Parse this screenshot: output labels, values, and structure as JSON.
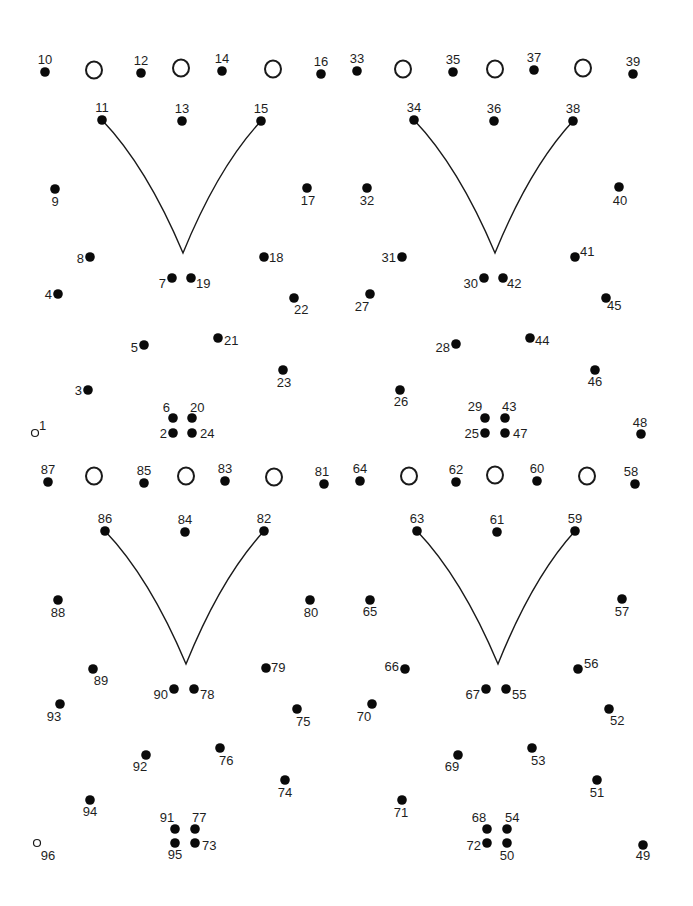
{
  "puzzle": {
    "type": "dot-to-dot",
    "total_dots": 96,
    "start_dot": 1,
    "end_dot": 96,
    "colors": {
      "ink": "#111111",
      "background": "#ffffff"
    }
  },
  "dots": [
    {
      "n": 1,
      "x": 35,
      "y": 433,
      "lx": 39,
      "ly": 430,
      "anchor": "start",
      "open": true
    },
    {
      "n": 2,
      "x": 173,
      "y": 433,
      "lx": 167,
      "ly": 438,
      "anchor": "end"
    },
    {
      "n": 3,
      "x": 88,
      "y": 390,
      "lx": 82,
      "ly": 395,
      "anchor": "end"
    },
    {
      "n": 4,
      "x": 58,
      "y": 294,
      "lx": 52,
      "ly": 299,
      "anchor": "end"
    },
    {
      "n": 5,
      "x": 144,
      "y": 345,
      "lx": 138,
      "ly": 352,
      "anchor": "end"
    },
    {
      "n": 6,
      "x": 173,
      "y": 418,
      "lx": 170,
      "ly": 412,
      "anchor": "end"
    },
    {
      "n": 7,
      "x": 172,
      "y": 278,
      "lx": 166,
      "ly": 288,
      "anchor": "end"
    },
    {
      "n": 8,
      "x": 90,
      "y": 257,
      "lx": 84,
      "ly": 263,
      "anchor": "end"
    },
    {
      "n": 9,
      "x": 55,
      "y": 189,
      "lx": 55,
      "ly": 206,
      "anchor": "middle"
    },
    {
      "n": 10,
      "x": 45,
      "y": 72,
      "lx": 45,
      "ly": 64,
      "anchor": "middle"
    },
    {
      "n": 11,
      "x": 102,
      "y": 120,
      "lx": 102,
      "ly": 112,
      "anchor": "middle"
    },
    {
      "n": 12,
      "x": 141,
      "y": 73,
      "lx": 141,
      "ly": 65,
      "anchor": "middle"
    },
    {
      "n": 13,
      "x": 182,
      "y": 121,
      "lx": 182,
      "ly": 113,
      "anchor": "middle"
    },
    {
      "n": 14,
      "x": 222,
      "y": 71,
      "lx": 222,
      "ly": 63,
      "anchor": "middle"
    },
    {
      "n": 15,
      "x": 261,
      "y": 121,
      "lx": 261,
      "ly": 113,
      "anchor": "middle"
    },
    {
      "n": 16,
      "x": 321,
      "y": 74,
      "lx": 321,
      "ly": 66,
      "anchor": "middle"
    },
    {
      "n": 17,
      "x": 307,
      "y": 188,
      "lx": 308,
      "ly": 205,
      "anchor": "middle"
    },
    {
      "n": 18,
      "x": 264,
      "y": 257,
      "lx": 269,
      "ly": 262,
      "anchor": "start"
    },
    {
      "n": 19,
      "x": 191,
      "y": 278,
      "lx": 196,
      "ly": 288,
      "anchor": "start"
    },
    {
      "n": 20,
      "x": 192,
      "y": 418,
      "lx": 190,
      "ly": 412,
      "anchor": "start"
    },
    {
      "n": 21,
      "x": 218,
      "y": 338,
      "lx": 224,
      "ly": 345,
      "anchor": "start"
    },
    {
      "n": 22,
      "x": 294,
      "y": 298,
      "lx": 294,
      "ly": 314,
      "anchor": "start"
    },
    {
      "n": 23,
      "x": 283,
      "y": 370,
      "lx": 284,
      "ly": 387,
      "anchor": "middle"
    },
    {
      "n": 24,
      "x": 192,
      "y": 433,
      "lx": 200,
      "ly": 438,
      "anchor": "start"
    },
    {
      "n": 25,
      "x": 485,
      "y": 433,
      "lx": 479,
      "ly": 438,
      "anchor": "end"
    },
    {
      "n": 26,
      "x": 400,
      "y": 390,
      "lx": 401,
      "ly": 406,
      "anchor": "middle"
    },
    {
      "n": 27,
      "x": 370,
      "y": 294,
      "lx": 362,
      "ly": 311,
      "anchor": "middle"
    },
    {
      "n": 28,
      "x": 456,
      "y": 344,
      "lx": 450,
      "ly": 352,
      "anchor": "end"
    },
    {
      "n": 29,
      "x": 485,
      "y": 418,
      "lx": 475,
      "ly": 411,
      "anchor": "middle"
    },
    {
      "n": 30,
      "x": 484,
      "y": 278,
      "lx": 478,
      "ly": 288,
      "anchor": "end"
    },
    {
      "n": 31,
      "x": 402,
      "y": 257,
      "lx": 396,
      "ly": 262,
      "anchor": "end"
    },
    {
      "n": 32,
      "x": 367,
      "y": 188,
      "lx": 367,
      "ly": 205,
      "anchor": "middle"
    },
    {
      "n": 33,
      "x": 357,
      "y": 71,
      "lx": 357,
      "ly": 63,
      "anchor": "middle"
    },
    {
      "n": 34,
      "x": 414,
      "y": 120,
      "lx": 414,
      "ly": 112,
      "anchor": "middle"
    },
    {
      "n": 35,
      "x": 453,
      "y": 72,
      "lx": 453,
      "ly": 64,
      "anchor": "middle"
    },
    {
      "n": 36,
      "x": 494,
      "y": 121,
      "lx": 494,
      "ly": 113,
      "anchor": "middle"
    },
    {
      "n": 37,
      "x": 534,
      "y": 70,
      "lx": 534,
      "ly": 62,
      "anchor": "middle"
    },
    {
      "n": 38,
      "x": 573,
      "y": 121,
      "lx": 573,
      "ly": 113,
      "anchor": "middle"
    },
    {
      "n": 39,
      "x": 633,
      "y": 74,
      "lx": 633,
      "ly": 66,
      "anchor": "middle"
    },
    {
      "n": 40,
      "x": 619,
      "y": 187,
      "lx": 620,
      "ly": 205,
      "anchor": "middle"
    },
    {
      "n": 41,
      "x": 575,
      "y": 257,
      "lx": 580,
      "ly": 256,
      "anchor": "start"
    },
    {
      "n": 42,
      "x": 503,
      "y": 278,
      "lx": 507,
      "ly": 288,
      "anchor": "start"
    },
    {
      "n": 43,
      "x": 505,
      "y": 418,
      "lx": 502,
      "ly": 411,
      "anchor": "start"
    },
    {
      "n": 44,
      "x": 530,
      "y": 338,
      "lx": 535,
      "ly": 345,
      "anchor": "start"
    },
    {
      "n": 45,
      "x": 606,
      "y": 298,
      "lx": 607,
      "ly": 310,
      "anchor": "start"
    },
    {
      "n": 46,
      "x": 595,
      "y": 370,
      "lx": 595,
      "ly": 386,
      "anchor": "middle"
    },
    {
      "n": 47,
      "x": 505,
      "y": 433,
      "lx": 513,
      "ly": 438,
      "anchor": "start"
    },
    {
      "n": 48,
      "x": 641,
      "y": 434,
      "lx": 640,
      "ly": 427,
      "anchor": "middle"
    },
    {
      "n": 49,
      "x": 643,
      "y": 845,
      "lx": 643,
      "ly": 860,
      "anchor": "middle"
    },
    {
      "n": 50,
      "x": 507,
      "y": 843,
      "lx": 507,
      "ly": 860,
      "anchor": "middle"
    },
    {
      "n": 51,
      "x": 597,
      "y": 780,
      "lx": 597,
      "ly": 797,
      "anchor": "middle"
    },
    {
      "n": 52,
      "x": 609,
      "y": 709,
      "lx": 610,
      "ly": 725,
      "anchor": "start"
    },
    {
      "n": 53,
      "x": 532,
      "y": 748,
      "lx": 531,
      "ly": 765,
      "anchor": "start"
    },
    {
      "n": 54,
      "x": 507,
      "y": 829,
      "lx": 505,
      "ly": 822,
      "anchor": "start"
    },
    {
      "n": 55,
      "x": 506,
      "y": 689,
      "lx": 512,
      "ly": 699,
      "anchor": "start"
    },
    {
      "n": 56,
      "x": 578,
      "y": 669,
      "lx": 584,
      "ly": 668,
      "anchor": "start"
    },
    {
      "n": 57,
      "x": 622,
      "y": 599,
      "lx": 622,
      "ly": 616,
      "anchor": "middle"
    },
    {
      "n": 58,
      "x": 635,
      "y": 484,
      "lx": 631,
      "ly": 476,
      "anchor": "middle"
    },
    {
      "n": 59,
      "x": 575,
      "y": 531,
      "lx": 575,
      "ly": 523,
      "anchor": "middle"
    },
    {
      "n": 60,
      "x": 537,
      "y": 481,
      "lx": 537,
      "ly": 473,
      "anchor": "middle"
    },
    {
      "n": 61,
      "x": 497,
      "y": 532,
      "lx": 497,
      "ly": 524,
      "anchor": "middle"
    },
    {
      "n": 62,
      "x": 456,
      "y": 482,
      "lx": 456,
      "ly": 474,
      "anchor": "middle"
    },
    {
      "n": 63,
      "x": 417,
      "y": 531,
      "lx": 417,
      "ly": 523,
      "anchor": "middle"
    },
    {
      "n": 64,
      "x": 360,
      "y": 481,
      "lx": 360,
      "ly": 473,
      "anchor": "middle"
    },
    {
      "n": 65,
      "x": 370,
      "y": 600,
      "lx": 370,
      "ly": 616,
      "anchor": "middle"
    },
    {
      "n": 66,
      "x": 405,
      "y": 669,
      "lx": 399,
      "ly": 671,
      "anchor": "end"
    },
    {
      "n": 67,
      "x": 486,
      "y": 689,
      "lx": 480,
      "ly": 699,
      "anchor": "end"
    },
    {
      "n": 68,
      "x": 487,
      "y": 829,
      "lx": 479,
      "ly": 822,
      "anchor": "middle"
    },
    {
      "n": 69,
      "x": 458,
      "y": 755,
      "lx": 452,
      "ly": 771,
      "anchor": "middle"
    },
    {
      "n": 70,
      "x": 372,
      "y": 704,
      "lx": 364,
      "ly": 721,
      "anchor": "middle"
    },
    {
      "n": 71,
      "x": 402,
      "y": 800,
      "lx": 401,
      "ly": 817,
      "anchor": "middle"
    },
    {
      "n": 72,
      "x": 487,
      "y": 843,
      "lx": 481,
      "ly": 850,
      "anchor": "end"
    },
    {
      "n": 73,
      "x": 195,
      "y": 843,
      "lx": 202,
      "ly": 850,
      "anchor": "start"
    },
    {
      "n": 74,
      "x": 285,
      "y": 780,
      "lx": 285,
      "ly": 797,
      "anchor": "middle"
    },
    {
      "n": 75,
      "x": 297,
      "y": 709,
      "lx": 296,
      "ly": 726,
      "anchor": "start"
    },
    {
      "n": 76,
      "x": 220,
      "y": 748,
      "lx": 219,
      "ly": 765,
      "anchor": "start"
    },
    {
      "n": 77,
      "x": 195,
      "y": 829,
      "lx": 192,
      "ly": 822,
      "anchor": "start"
    },
    {
      "n": 78,
      "x": 194,
      "y": 689,
      "lx": 200,
      "ly": 699,
      "anchor": "start"
    },
    {
      "n": 79,
      "x": 266,
      "y": 668,
      "lx": 271,
      "ly": 672,
      "anchor": "start"
    },
    {
      "n": 80,
      "x": 310,
      "y": 600,
      "lx": 311,
      "ly": 617,
      "anchor": "middle"
    },
    {
      "n": 81,
      "x": 324,
      "y": 484,
      "lx": 322,
      "ly": 476,
      "anchor": "middle"
    },
    {
      "n": 82,
      "x": 264,
      "y": 531,
      "lx": 264,
      "ly": 523,
      "anchor": "middle"
    },
    {
      "n": 83,
      "x": 225,
      "y": 481,
      "lx": 225,
      "ly": 473,
      "anchor": "middle"
    },
    {
      "n": 84,
      "x": 185,
      "y": 532,
      "lx": 185,
      "ly": 524,
      "anchor": "middle"
    },
    {
      "n": 85,
      "x": 144,
      "y": 483,
      "lx": 144,
      "ly": 475,
      "anchor": "middle"
    },
    {
      "n": 86,
      "x": 105,
      "y": 531,
      "lx": 105,
      "ly": 523,
      "anchor": "middle"
    },
    {
      "n": 87,
      "x": 48,
      "y": 482,
      "lx": 48,
      "ly": 474,
      "anchor": "middle"
    },
    {
      "n": 88,
      "x": 58,
      "y": 600,
      "lx": 58,
      "ly": 617,
      "anchor": "middle"
    },
    {
      "n": 89,
      "x": 93,
      "y": 669,
      "lx": 101,
      "ly": 685,
      "anchor": "middle"
    },
    {
      "n": 90,
      "x": 174,
      "y": 689,
      "lx": 168,
      "ly": 699,
      "anchor": "end"
    },
    {
      "n": 91,
      "x": 175,
      "y": 829,
      "lx": 167,
      "ly": 822,
      "anchor": "middle"
    },
    {
      "n": 92,
      "x": 146,
      "y": 755,
      "lx": 140,
      "ly": 771,
      "anchor": "middle"
    },
    {
      "n": 93,
      "x": 60,
      "y": 704,
      "lx": 54,
      "ly": 721,
      "anchor": "middle"
    },
    {
      "n": 94,
      "x": 90,
      "y": 800,
      "lx": 90,
      "ly": 816,
      "anchor": "middle"
    },
    {
      "n": 95,
      "x": 175,
      "y": 843,
      "lx": 175,
      "ly": 859,
      "anchor": "middle"
    },
    {
      "n": 96,
      "x": 37,
      "y": 843,
      "lx": 48,
      "ly": 860,
      "anchor": "middle",
      "open": true
    }
  ],
  "rings": [
    {
      "x": 94,
      "y": 70
    },
    {
      "x": 181,
      "y": 68
    },
    {
      "x": 273,
      "y": 69
    },
    {
      "x": 403,
      "y": 69
    },
    {
      "x": 495,
      "y": 69
    },
    {
      "x": 583,
      "y": 68
    },
    {
      "x": 94,
      "y": 476
    },
    {
      "x": 186,
      "y": 476
    },
    {
      "x": 274,
      "y": 477
    },
    {
      "x": 409,
      "y": 476
    },
    {
      "x": 495,
      "y": 475
    },
    {
      "x": 587,
      "y": 476
    }
  ],
  "v_curves": [
    {
      "left": [
        102,
        120
      ],
      "tip": [
        183,
        253
      ],
      "right": [
        261,
        121
      ]
    },
    {
      "left": [
        414,
        120
      ],
      "tip": [
        495,
        253
      ],
      "right": [
        573,
        121
      ]
    },
    {
      "left": [
        105,
        531
      ],
      "tip": [
        186,
        664
      ],
      "right": [
        264,
        531
      ]
    },
    {
      "left": [
        417,
        531
      ],
      "tip": [
        498,
        664
      ],
      "right": [
        575,
        531
      ]
    }
  ]
}
